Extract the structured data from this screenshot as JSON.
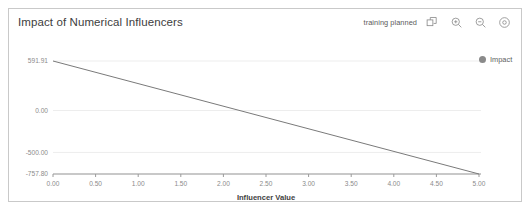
{
  "card": {
    "title": "Impact of Numerical Influencers",
    "status": "training planned"
  },
  "toolbar": {
    "items": [
      {
        "name": "popout-icon",
        "label": "Popout"
      },
      {
        "name": "zoom-in-icon",
        "label": "Zoom In"
      },
      {
        "name": "zoom-out-icon",
        "label": "Zoom Out"
      },
      {
        "name": "settings-icon",
        "label": "Settings"
      }
    ]
  },
  "legend": {
    "entries": [
      {
        "label": "Impact",
        "color": "#8a8a8a"
      }
    ]
  },
  "chart_data": {
    "type": "line",
    "title": "Impact of Numerical Influencers",
    "xlabel": "Influencer Value",
    "ylabel": "",
    "series": [
      {
        "name": "Impact",
        "color": "#7a7a7a",
        "x": [
          0.0,
          5.0
        ],
        "y": [
          591.91,
          -757.8
        ]
      }
    ],
    "xlim": [
      0.0,
      5.0
    ],
    "ylim": [
      -757.8,
      591.91
    ],
    "xticks": [
      0.0,
      0.5,
      1.0,
      1.5,
      2.0,
      2.5,
      3.0,
      3.5,
      4.0,
      4.5,
      5.0
    ],
    "xticklabels": [
      "0.00",
      "0.50",
      "1.00",
      "1.50",
      "2.00",
      "2.50",
      "3.00",
      "3.50",
      "4.00",
      "4.50",
      "5.00"
    ],
    "yticks": [
      591.91,
      0.0,
      -500.0,
      -757.8
    ],
    "yticklabels": [
      "591.91",
      "0.00",
      "-500.00",
      "-757.80"
    ],
    "grid": true,
    "grid_axis": "y",
    "legend_position": "right"
  }
}
